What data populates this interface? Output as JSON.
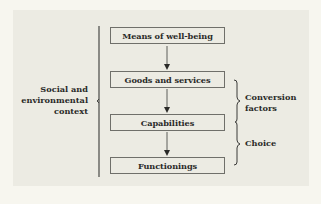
{
  "diagram": {
    "nodes": [
      {
        "id": "means",
        "label": "Means of well-being"
      },
      {
        "id": "goods",
        "label": "Goods and services"
      },
      {
        "id": "capabilities",
        "label": "Capabilities"
      },
      {
        "id": "functionings",
        "label": "Functionings"
      }
    ],
    "edges": [
      {
        "from": "means",
        "to": "goods"
      },
      {
        "from": "goods",
        "to": "capabilities"
      },
      {
        "from": "capabilities",
        "to": "functionings"
      }
    ],
    "brackets": {
      "left": {
        "label_line1": "Social and",
        "label_line2": "environmental",
        "label_line3": "context",
        "spans": [
          "means",
          "functionings"
        ]
      },
      "right_top": {
        "label_line1": "Conversion",
        "label_line2": "factors",
        "spans": [
          "goods",
          "capabilities"
        ]
      },
      "right_bottom": {
        "label": "Choice",
        "spans": [
          "capabilities",
          "functionings"
        ]
      }
    },
    "colors": {
      "page_background": "#f7f6ef",
      "panel_background": "#ecebe3",
      "box_border": "#6f6f6a",
      "text": "#2a2a28",
      "lines": "#3a3a38"
    }
  }
}
